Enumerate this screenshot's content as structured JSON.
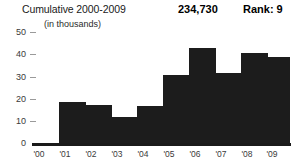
{
  "header": {
    "title": "Cumulative 2000-2009",
    "value": "234,730",
    "rank": "Rank: 9",
    "units": "(in thousands)"
  },
  "axis": {
    "y_ticks": [
      "50",
      "40",
      "30",
      "20",
      "10",
      "0"
    ],
    "x_ticks": [
      "'00",
      "'01",
      "'02",
      "'03",
      "'04",
      "'05",
      "'06",
      "'07",
      "'08",
      "'09"
    ]
  },
  "colors": {
    "bar": "#1c1c1c",
    "axis": "#1a1a1a",
    "tick_label": "#3a3a3a",
    "background": "#ffffff"
  },
  "chart_data": {
    "type": "bar",
    "title": "Cumulative 2000-2009",
    "subtitle": "(in thousands)",
    "xlabel": "",
    "ylabel": "",
    "ylim": [
      0,
      50
    ],
    "yticks": [
      0,
      10,
      20,
      30,
      40,
      50
    ],
    "grid": false,
    "legend": "none",
    "categories": [
      "'00",
      "'01",
      "'02",
      "'03",
      "'04",
      "'05",
      "'06",
      "'07",
      "'08",
      "'09"
    ],
    "values": [
      0,
      18,
      17,
      11.5,
      16.5,
      30,
      42,
      31,
      40,
      38
    ],
    "total_label": "234,730",
    "rank_label": "Rank: 9"
  }
}
